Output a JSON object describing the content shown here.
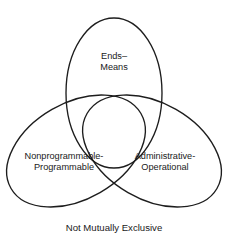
{
  "diagram": {
    "type": "venn-three-set",
    "caption": "Not Mutually Exclusive",
    "stroke_color": "#1d1d1d",
    "background_color": "#ffffff",
    "sets": [
      {
        "id": "ends-means",
        "position": "top",
        "lines": [
          "Ends–",
          "Means"
        ],
        "label_full": "Ends–Means"
      },
      {
        "id": "nonprogrammable-programmable",
        "position": "bottom-left",
        "lines": [
          "Nonprogrammable-",
          "Programmable"
        ],
        "label_full": "Nonprogrammable-Programmable"
      },
      {
        "id": "administrative-operational",
        "position": "bottom-right",
        "lines": [
          "Administrative-",
          "Operational"
        ],
        "label_full": "Administrative-Operational"
      }
    ]
  }
}
